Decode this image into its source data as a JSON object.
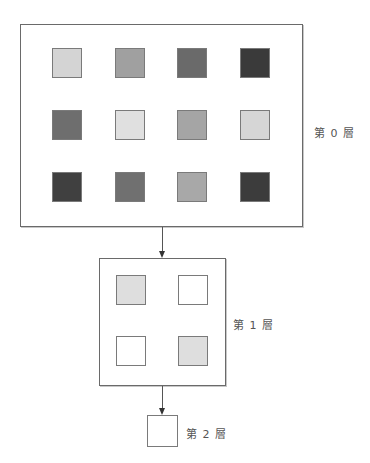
{
  "diagram": {
    "layers": [
      {
        "label": "第 0 層",
        "rows": 3,
        "cols": 4,
        "cells": [
          [
            "#d4d4d4",
            "#a0a0a0",
            "#6a6a6a",
            "#3a3a3a"
          ],
          [
            "#6e6e6e",
            "#e0e0e0",
            "#a5a5a5",
            "#d6d6d6"
          ],
          [
            "#404040",
            "#707070",
            "#a8a8a8",
            "#3c3c3c"
          ]
        ]
      },
      {
        "label": "第 1 層",
        "rows": 2,
        "cols": 2,
        "cells": [
          [
            "#dedede",
            "#ffffff"
          ],
          [
            "#ffffff",
            "#dedede"
          ]
        ]
      },
      {
        "label": "第 2 層",
        "rows": 1,
        "cols": 1,
        "cells": [
          [
            "#ffffff"
          ]
        ]
      }
    ],
    "colors": {
      "border": "#6a6a6a",
      "arrow": "#333333",
      "label": "#555555"
    }
  }
}
